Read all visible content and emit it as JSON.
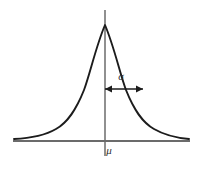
{
  "figure": {
    "name": "normal-distribution-bell-curve",
    "width": 203,
    "height": 171,
    "background_color": "#ffffff"
  },
  "labels": {
    "sigma": "σ",
    "mu": "μ",
    "sigma_font_size": 11,
    "mu_font_size": 11,
    "sigma_x": 121,
    "sigma_y": 77,
    "mu_x": 109,
    "mu_y": 151,
    "text_color": "#2b2b2b"
  },
  "axes": {
    "x_axis": {
      "y": 141,
      "x_start": 13,
      "x_end": 190,
      "color": "#3a3a3a",
      "width": 1.6
    },
    "y_axis": {
      "x": 105,
      "y_start": 10,
      "y_end": 156,
      "color": "#6b6b6b",
      "width": 1.5
    }
  },
  "curve": {
    "color": "#1c1c1c",
    "width": 1.9,
    "peak_x": 105,
    "peak_y": 25,
    "baseline_y": 141,
    "left_tail_x": 14,
    "right_tail_x": 189,
    "inflection_x": 143,
    "inflection_y": 89,
    "path": "M 14 139 C 30 138.2 44 136 56 129 C 68 122 76 110 84 90 C 90 74 96 46 105 25 C 114 46 120 74 126 90 C 134 110 142 122 154 129 C 166 136 180 138.2 189 139"
  },
  "sigma_arrow": {
    "y": 89,
    "x_start": 105,
    "x_end": 143,
    "color": "#1c1c1c",
    "width": 1.5,
    "head_length": 6,
    "head_half_width": 3.4,
    "left_head_points": "105,89 112,85.6 112,92.4",
    "right_head_points": "143,89 136,85.6 136,92.4"
  },
  "chart_data": {
    "type": "line",
    "title": "",
    "subtitle": "",
    "xlabel": "",
    "ylabel": "",
    "legend": [],
    "annotations": [
      {
        "name": "standard-deviation-span",
        "label": "σ",
        "kind": "double-headed-arrow",
        "from_x": 0,
        "to_x": 1,
        "at_y": 0.6065,
        "meaning": "one standard deviation from the mean to the inflection point"
      },
      {
        "name": "mean-tick",
        "label": "μ",
        "kind": "axis-label",
        "at_x": 0,
        "meaning": "mean of the distribution marked on the horizontal axis"
      }
    ],
    "function": "gaussian probability density",
    "x": [
      -3,
      -2.5,
      -2,
      -1.5,
      -1,
      -0.5,
      0,
      0.5,
      1,
      1.5,
      2,
      2.5,
      3
    ],
    "values": [
      0.0111,
      0.0439,
      0.1353,
      0.3247,
      0.6065,
      0.8825,
      1.0,
      0.8825,
      0.6065,
      0.3247,
      0.1353,
      0.0439,
      0.0111
    ],
    "xlim": [
      -3.2,
      3.2
    ],
    "ylim": [
      0,
      1.08
    ],
    "grid": false,
    "legend_position": "none"
  }
}
